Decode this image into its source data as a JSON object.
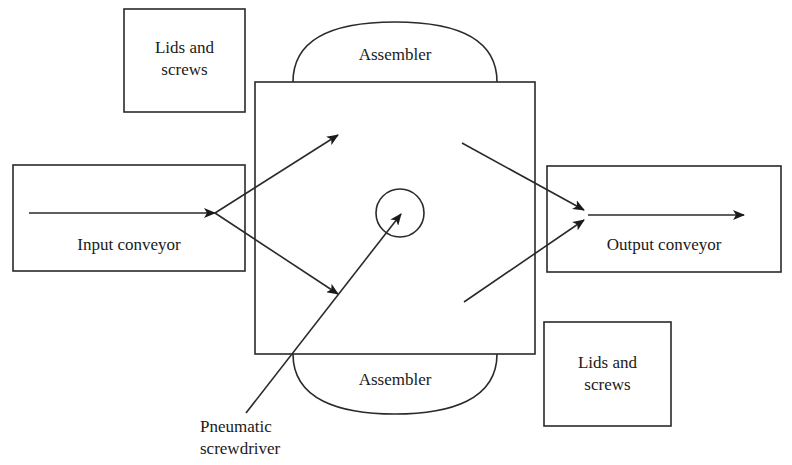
{
  "diagram": {
    "stations": {
      "lids_top": {
        "line1": "Lids and",
        "line2": "screws"
      },
      "lids_bottom": {
        "line1": "Lids and",
        "line2": "screws"
      },
      "assembler_top": {
        "label": "Assembler"
      },
      "assembler_bottom": {
        "label": "Assembler"
      },
      "input_conveyor": {
        "label": "Input conveyor"
      },
      "output_conveyor": {
        "label": "Output conveyor"
      },
      "screwdriver": {
        "line1": "Pneumatic",
        "line2": "screwdriver"
      }
    },
    "colors": {
      "stroke": "#2a2a2a",
      "background": "#ffffff"
    }
  }
}
